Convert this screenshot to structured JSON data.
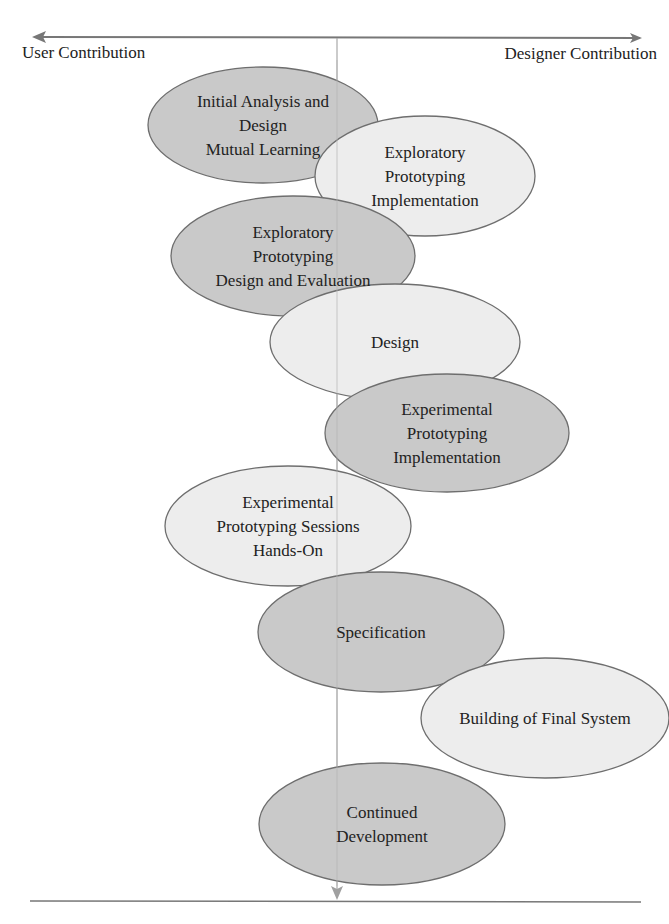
{
  "diagram": {
    "axis": {
      "left_label": "User Contribution",
      "right_label": "Designer Contribution"
    },
    "colors": {
      "dark_fill": "#c9c9c9",
      "light_fill": "#ededed",
      "stroke": "#6e6e6e",
      "axis_line": "#777777",
      "center_line": "#a8a8a8"
    },
    "stages": [
      {
        "lines": [
          "Initial Analysis and",
          "Design",
          "Mutual Learning"
        ],
        "shade": "dark",
        "cx": 263,
        "cy": 125,
        "rx": 115,
        "ry": 58
      },
      {
        "lines": [
          "Exploratory",
          "Prototyping",
          "Implementation"
        ],
        "shade": "light",
        "cx": 425,
        "cy": 176,
        "rx": 110,
        "ry": 60
      },
      {
        "lines": [
          "Exploratory",
          "Prototyping",
          "Design and Evaluation"
        ],
        "shade": "dark",
        "cx": 293,
        "cy": 256,
        "rx": 122,
        "ry": 60
      },
      {
        "lines": [
          "Design"
        ],
        "shade": "light",
        "cx": 395,
        "cy": 342,
        "rx": 125,
        "ry": 58
      },
      {
        "lines": [
          "Experimental",
          "Prototyping",
          "Implementation"
        ],
        "shade": "dark",
        "cx": 447,
        "cy": 433,
        "rx": 122,
        "ry": 59
      },
      {
        "lines": [
          "Experimental",
          "Prototyping Sessions",
          "Hands-On"
        ],
        "shade": "light",
        "cx": 288,
        "cy": 526,
        "rx": 123,
        "ry": 60
      },
      {
        "lines": [
          "Specification"
        ],
        "shade": "dark",
        "cx": 381,
        "cy": 632,
        "rx": 123,
        "ry": 60
      },
      {
        "lines": [
          "Building of Final System"
        ],
        "shade": "light",
        "cx": 545,
        "cy": 718,
        "rx": 124,
        "ry": 60
      },
      {
        "lines": [
          "Continued",
          "Development"
        ],
        "shade": "dark",
        "cx": 382,
        "cy": 824,
        "rx": 123,
        "ry": 61
      }
    ]
  }
}
